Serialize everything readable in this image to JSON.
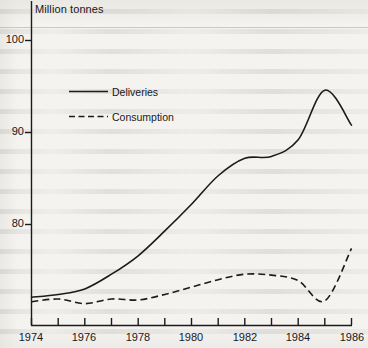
{
  "chart_data": {
    "type": "line",
    "title": "Million tonnes",
    "xlabel": "",
    "ylabel": "Million tonnes",
    "xlim": [
      1974,
      1986
    ],
    "ylim": [
      71,
      102
    ],
    "grid": false,
    "legend_position": "inside-upper-left",
    "xticks": [
      1974,
      1975,
      1976,
      1977,
      1978,
      1979,
      1980,
      1981,
      1982,
      1983,
      1984,
      1985,
      1986
    ],
    "xtick_labels": [
      "1974",
      "",
      "1976",
      "",
      "1978",
      "",
      "1980",
      "",
      "1982",
      "",
      "1984",
      "",
      "1986"
    ],
    "yticks": [
      80,
      90,
      100
    ],
    "ytick_labels": [
      "80",
      "90",
      "100"
    ],
    "x": [
      1974,
      1975,
      1976,
      1977,
      1978,
      1979,
      1980,
      1981,
      1982,
      1983,
      1984,
      1985,
      1986
    ],
    "series": [
      {
        "name": "Deliveries",
        "style": "solid",
        "color": "#1b1b1d",
        "values": [
          72.1,
          72.4,
          73.0,
          74.6,
          76.6,
          79.3,
          82.2,
          85.3,
          87.2,
          87.4,
          89.2,
          94.6,
          90.8
        ]
      },
      {
        "name": "Consumption",
        "style": "dashed",
        "color": "#1b1b1d",
        "values": [
          71.6,
          71.9,
          71.4,
          71.9,
          71.8,
          72.4,
          73.2,
          74.0,
          74.6,
          74.5,
          73.9,
          71.7,
          77.4
        ]
      }
    ]
  },
  "title": {
    "text": "Million tonnes"
  },
  "axes": {
    "y_tick_100": "100",
    "y_tick_90": "90",
    "y_tick_80": "80",
    "x_tick_1974": "1974",
    "x_tick_1976": "1976",
    "x_tick_1978": "1978",
    "x_tick_1980": "1980",
    "x_tick_1982": "1982",
    "x_tick_1984": "1984",
    "x_tick_1986": "1986"
  },
  "legend": {
    "items": [
      {
        "label": "Deliveries",
        "style": "solid"
      },
      {
        "label": "Consumption",
        "style": "dashed"
      }
    ]
  }
}
